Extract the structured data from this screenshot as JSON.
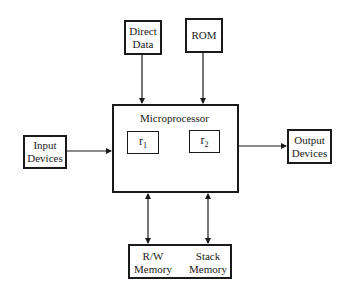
{
  "diagram": {
    "nodes": {
      "direct_data": {
        "line1": "Direct",
        "line2": "Data"
      },
      "rom": {
        "label": "ROM"
      },
      "microprocessor": {
        "title": "Microprocessor"
      },
      "r1": {
        "base": "r",
        "sub": "1"
      },
      "r2": {
        "base": "r",
        "sub": "2"
      },
      "input_devices": {
        "line1": "Input",
        "line2": "Devices"
      },
      "output_devices": {
        "line1": "Output",
        "line2": "Devices"
      },
      "rw_memory": {
        "line1": "R/W",
        "line2": "Memory"
      },
      "stack_memory": {
        "line1": "Stack",
        "line2": "Memory"
      }
    },
    "edges": [
      {
        "from": "direct_data",
        "to": "microprocessor",
        "direction": "one-way"
      },
      {
        "from": "rom",
        "to": "microprocessor",
        "direction": "one-way"
      },
      {
        "from": "input_devices",
        "to": "microprocessor",
        "direction": "one-way"
      },
      {
        "from": "microprocessor",
        "to": "output_devices",
        "direction": "one-way"
      },
      {
        "from": "microprocessor",
        "to": "rw_memory",
        "direction": "two-way"
      },
      {
        "from": "microprocessor",
        "to": "stack_memory",
        "direction": "two-way"
      },
      {
        "from": "r1",
        "to": "r2",
        "direction": "two-way",
        "style": "curved"
      }
    ]
  }
}
